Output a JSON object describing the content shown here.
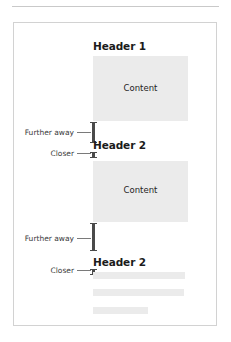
{
  "diagram": {
    "title_rule": "horizontal-rule",
    "sections": [
      {
        "heading": "Header 1",
        "content_label": "Content"
      },
      {
        "heading": "Header 2",
        "content_label": "Content"
      },
      {
        "heading": "Header 2",
        "content_label": ""
      }
    ],
    "annotations": [
      {
        "label": "Further away",
        "id": "far-1"
      },
      {
        "label": "Closer",
        "id": "closer-1"
      },
      {
        "label": "Further away",
        "id": "far-2"
      },
      {
        "label": "Closer",
        "id": "closer-2"
      }
    ],
    "colors": {
      "content_fill": "#ebebeb",
      "heading_text": "#1b1b1b",
      "annotation_text": "#3a3a3a",
      "measure_bar": "#4a4a4a",
      "leader_line": "#7a7a7a",
      "card_border": "#d2d2d2",
      "top_rule": "#c9c9c9",
      "background": "#ffffff"
    }
  }
}
